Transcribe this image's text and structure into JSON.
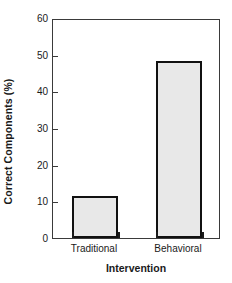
{
  "chart_data": {
    "type": "bar",
    "title": "",
    "xlabel": "Intervention",
    "ylabel": "Correct Components (%)",
    "categories": [
      "Traditional",
      "Behavioral"
    ],
    "values": [
      11.5,
      48.3
    ],
    "ylim": [
      0,
      60
    ],
    "yticks": [
      0,
      10,
      20,
      30,
      40,
      50,
      60
    ],
    "ytick_labels": [
      "0",
      "10",
      "20",
      "30",
      "40",
      "50",
      "60"
    ],
    "grid": false,
    "legend": false,
    "bar_fill_color": "#e8e8e8",
    "bar_edge_color": "#111111",
    "axis_color": "#3a3a3a",
    "background_color": "#ffffff"
  }
}
